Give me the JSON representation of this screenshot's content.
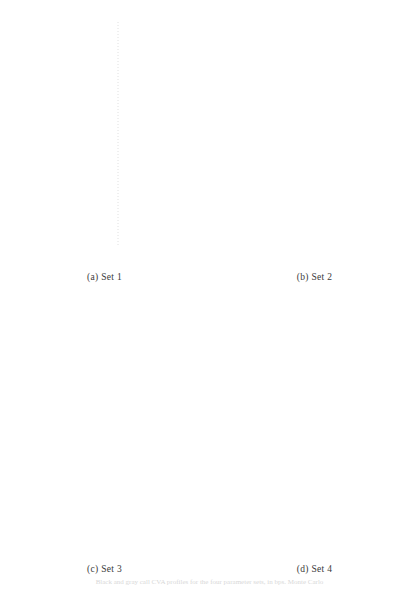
{
  "figure": {
    "caption": "Black and gray call CVA profiles for the four parameter sets, in bps. Monte Carlo",
    "panels": [
      {
        "id": "a",
        "subcaption": "(a) Set 1",
        "xlabel": "ρ",
        "ylabel": "Call CVA [bps]",
        "xticks": [
          "-0.5",
          "0.0",
          "0.5"
        ],
        "xtickvals": [
          -0.5,
          0.0,
          0.5
        ],
        "yticks": [
          "0",
          "500",
          "1000",
          "1500",
          "2000"
        ],
        "ytickvals": [
          0,
          500,
          1000,
          1500,
          2000
        ],
        "xlim": [
          -0.95,
          0.95
        ],
        "ylim": [
          -20,
          2250
        ]
      },
      {
        "id": "b",
        "subcaption": "(b) Set 2",
        "xlabel": "ρ",
        "ylabel": "Call CVA [bps]",
        "xticks": [
          "-0.5",
          "0.0",
          "0.5"
        ],
        "xtickvals": [
          -0.5,
          0.0,
          0.5
        ],
        "yticks": [
          "500",
          "1000",
          "1500",
          "2000"
        ],
        "ytickvals": [
          500,
          1000,
          1500,
          2000
        ],
        "xlim": [
          -0.95,
          0.95
        ],
        "ylim": [
          200,
          2350
        ]
      },
      {
        "id": "c",
        "subcaption": "(c) Set 3",
        "xlabel": "ρ",
        "ylabel": "Call CVA [bps]",
        "xticks": [
          "-0.5",
          "0.0",
          "0.5"
        ],
        "xtickvals": [
          -0.5,
          0.0,
          0.5
        ],
        "yticks": [
          "0",
          "200",
          "400",
          "600",
          "800",
          "1000"
        ],
        "ytickvals": [
          0,
          200,
          400,
          600,
          800,
          1000
        ],
        "xlim": [
          -0.95,
          0.95
        ],
        "ylim": [
          -20,
          1100
        ]
      },
      {
        "id": "d",
        "subcaption": "(d) Set 4",
        "xlabel": "ρ",
        "ylabel": "Call CVA [bps]",
        "xticks": [
          "-0.5",
          "0.0",
          "0.5"
        ],
        "xtickvals": [
          -0.5,
          0.0,
          0.5
        ],
        "yticks": [
          "500",
          "1000",
          "1500",
          "2000"
        ],
        "ytickvals": [
          500,
          1000,
          1500,
          2000
        ],
        "xlim": [
          -0.95,
          0.95
        ],
        "ylim": [
          100,
          2300
        ]
      }
    ]
  },
  "style": {
    "frame_color": "#6e6e6e",
    "axis_text_color": "#3a3a3a",
    "dark_curve_color": "#1c1c1c",
    "marker_curve_color": "#707070",
    "light_curve_color": "#b9b9b9",
    "ghost_curve_color": "#ececec",
    "circle_level_color": "#c9d4dd",
    "triangle_level_color": "#ccd3cc",
    "vline_color": "#d8d8d8"
  },
  "chart_data": {
    "type": "line",
    "title": "",
    "xlabel": "ρ",
    "ylabel": "Call CVA [bps]",
    "legend": "none",
    "grid": false,
    "x": [
      -0.9,
      -0.8,
      -0.7,
      -0.6,
      -0.5,
      -0.4,
      -0.3,
      -0.2,
      -0.1,
      0.0,
      0.1,
      0.2,
      0.3,
      0.4,
      0.5,
      0.6,
      0.7,
      0.8,
      0.9
    ],
    "panels": [
      {
        "name": "Set 1",
        "xlim": [
          -0.95,
          0.95
        ],
        "ylim": [
          -20,
          2250
        ],
        "series": [
          {
            "name": "black CVA (solid dark)",
            "style": "solid-dark",
            "values": [
              430,
              448,
              465,
              482,
              498,
              515,
              532,
              550,
              568,
              588,
              608,
              628,
              650,
              670,
              690,
              706,
              720,
              730,
              738
            ]
          },
          {
            "name": "MC CVA (circles)",
            "style": "markers-circle",
            "values": [
              432,
              450,
              466,
              483,
              500,
              516,
              533,
              551,
              569,
              588,
              607,
              627,
              649,
              669,
              689,
              705,
              719,
              729,
              737
            ]
          },
          {
            "name": "gray CVA (light solid)",
            "style": "solid-light",
            "values": [
              460,
              473,
              487,
              500,
              514,
              528,
              542,
              557,
              572,
              588,
              604,
              620,
              637,
              654,
              671,
              688,
              705,
              722,
              739
            ]
          },
          {
            "name": "upper level (circles, dotted)",
            "style": "level-circle",
            "values": [
              800,
              800,
              800,
              800,
              800,
              800,
              800,
              800,
              800,
              800,
              800,
              800,
              800,
              800,
              800,
              800,
              800,
              800,
              800
            ]
          },
          {
            "name": "lower level (triangles, dotted)",
            "style": "level-triangle",
            "values": [
              560,
              560,
              560,
              560,
              560,
              560,
              560,
              560,
              560,
              560,
              560,
              560,
              560,
              560,
              560,
              560,
              560,
              560,
              560
            ]
          },
          {
            "name": "ghost reference curve",
            "style": "ghost",
            "values": [
              60,
              110,
              170,
              240,
              320,
              420,
              530,
              660,
              800,
              950,
              1110,
              1280,
              1450,
              1630,
              1810,
              1980,
              2120,
              2220,
              2280
            ]
          }
        ]
      },
      {
        "name": "Set 2",
        "xlim": [
          -0.95,
          0.95
        ],
        "ylim": [
          200,
          2350
        ],
        "series": [
          {
            "name": "black CVA (solid dark)",
            "style": "solid-dark",
            "values": [
              425,
              448,
              470,
              493,
              516,
              540,
              564,
              590,
              616,
              645,
              675,
              706,
              738,
              772,
              808,
              848,
              890,
              935,
              980
            ]
          },
          {
            "name": "MC CVA (circles)",
            "style": "markers-circle",
            "values": [
              422,
              446,
              469,
              492,
              515,
              539,
              564,
              589,
              615,
              646,
              676,
              707,
              739,
              773,
              809,
              849,
              891,
              936,
              981
            ]
          },
          {
            "name": "gray CVA (light solid)",
            "style": "solid-light",
            "values": [
              452,
              474,
              496,
              518,
              540,
              562,
              585,
              608,
              632,
              655,
              680,
              706,
              733,
              762,
              793,
              827,
              864,
              905,
              950
            ]
          },
          {
            "name": "upper level (circles, dotted)",
            "style": "level-circle",
            "values": [
              945,
              945,
              945,
              945,
              945,
              945,
              945,
              945,
              945,
              945,
              945,
              945,
              945,
              945,
              945,
              945,
              945,
              945,
              945
            ]
          },
          {
            "name": "lower level (triangles, dotted)",
            "style": "level-triangle",
            "values": [
              655,
              655,
              655,
              655,
              655,
              655,
              655,
              655,
              655,
              655,
              655,
              655,
              655,
              655,
              655,
              655,
              655,
              655,
              655
            ]
          },
          {
            "name": "ghost reference curve",
            "style": "ghost",
            "values": [
              270,
              320,
              380,
              450,
              530,
              625,
              735,
              860,
              1000,
              1150,
              1310,
              1480,
              1650,
              1830,
              2000,
              2150,
              2260,
              2330,
              2350
            ]
          }
        ]
      },
      {
        "name": "Set 3",
        "xlim": [
          -0.95,
          0.95
        ],
        "ylim": [
          -20,
          1100
        ],
        "series": [
          {
            "name": "black CVA (solid dark)",
            "style": "solid-dark",
            "values": [
              103,
              117,
              132,
              147,
              163,
              180,
              199,
              219,
              241,
              265,
              292,
              320,
              350,
              383,
              417,
              450,
              483,
              512,
              537
            ]
          },
          {
            "name": "MC CVA (circles)",
            "style": "markers-circle",
            "values": [
              105,
              119,
              133,
              148,
              164,
              181,
              200,
              220,
              242,
              266,
              292,
              318,
              346,
              375,
              404,
              432,
              455,
              470,
              478
            ]
          },
          {
            "name": "gray CVA (light solid)",
            "style": "solid-light",
            "values": [
              118,
              132,
              146,
              160,
              176,
              192,
              210,
              229,
              250,
              272,
              296,
              322,
              349,
              378,
              407,
              436,
              462,
              482,
              496
            ]
          },
          {
            "name": "upper level (circles, dotted)",
            "style": "level-circle",
            "values": [
              335,
              335,
              335,
              335,
              335,
              335,
              335,
              335,
              335,
              335,
              335,
              335,
              335,
              335,
              335,
              335,
              335,
              335,
              335
            ]
          },
          {
            "name": "lower level (triangles, dotted)",
            "style": "level-triangle",
            "values": [
              242,
              242,
              242,
              242,
              242,
              242,
              242,
              242,
              242,
              242,
              242,
              242,
              242,
              242,
              242,
              242,
              242,
              242,
              242
            ]
          },
          {
            "name": "ghost reference curve",
            "style": "ghost",
            "values": [
              25,
              45,
              70,
              105,
              150,
              205,
              275,
              355,
              450,
              555,
              670,
              790,
              910,
              1020,
              1090,
              1100,
              1100,
              1100,
              1100
            ]
          }
        ]
      },
      {
        "name": "Set 4",
        "xlim": [
          -0.95,
          0.95
        ],
        "ylim": [
          100,
          2300
        ],
        "series": [
          {
            "name": "black CVA (solid dark)",
            "style": "solid-dark",
            "values": [
              185,
              213,
              243,
              276,
              312,
              353,
              399,
              452,
              513,
              585,
              672,
              775,
              895,
              1030,
              1180,
              1345,
              1520,
              1710,
              1915
            ]
          },
          {
            "name": "MC CVA (circles)",
            "style": "markers-circle",
            "values": [
              188,
              216,
              246,
              279,
              315,
              356,
              402,
              455,
              516,
              586,
              665,
              752,
              848,
              952,
              1062,
              1175,
              1290,
              1410,
              1545
            ]
          },
          {
            "name": "gray CVA (light solid)",
            "style": "solid-light",
            "values": [
              245,
              272,
              300,
              330,
              362,
              397,
              436,
              479,
              527,
              581,
              641,
              707,
              778,
              852,
              930,
              1010,
              1093,
              1178,
              1268
            ]
          },
          {
            "name": "upper level (circles, dotted)",
            "style": "level-circle",
            "values": [
              840,
              840,
              840,
              840,
              840,
              840,
              840,
              840,
              840,
              840,
              840,
              840,
              840,
              840,
              840,
              840,
              840,
              840,
              840
            ]
          },
          {
            "name": "lower level (triangles, dotted)",
            "style": "level-triangle",
            "values": [
              600,
              600,
              600,
              600,
              600,
              600,
              600,
              600,
              600,
              600,
              600,
              600,
              600,
              600,
              600,
              600,
              600,
              600,
              600
            ]
          },
          {
            "name": "ghost reference curve",
            "style": "ghost",
            "values": [
              120,
              150,
              190,
              245,
              315,
              400,
              505,
              630,
              775,
              935,
              1110,
              1295,
              1490,
              1690,
              1890,
              2070,
              2200,
              2270,
              2295
            ]
          }
        ]
      }
    ]
  }
}
